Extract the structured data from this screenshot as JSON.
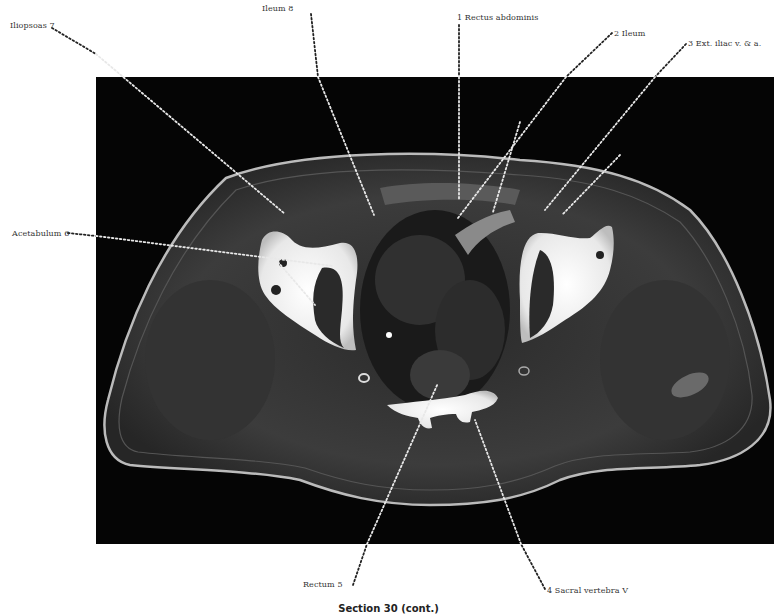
{
  "figure": {
    "type": "axial cross-section (pelvis)",
    "caption": "Section 30 (cont.)",
    "background_color": "#050505",
    "bone_color": "#f2f2f2",
    "soft_tissue_color": "#3a3a3a"
  },
  "labels": [
    {
      "id": 1,
      "text": "1 Rectus abdominis",
      "x": 457,
      "y": 13
    },
    {
      "id": 2,
      "text": "2 Ileum",
      "x": 614,
      "y": 29
    },
    {
      "id": 3,
      "text": "3 Ext. iliac v. & a.",
      "x": 688,
      "y": 39
    },
    {
      "id": 4,
      "text": "4 Sacral vertebra V",
      "x": 547,
      "y": 591
    },
    {
      "id": 5,
      "text": "Rectum  5",
      "x": 303,
      "y": 585
    },
    {
      "id": 6,
      "text": "Acetabulum 6",
      "x": 12,
      "y": 229
    },
    {
      "id": 7,
      "text": "Iliopsoas 7",
      "x": 10,
      "y": 21
    },
    {
      "id": 8,
      "text": "Ileum  8",
      "x": 276,
      "y": 4
    }
  ]
}
